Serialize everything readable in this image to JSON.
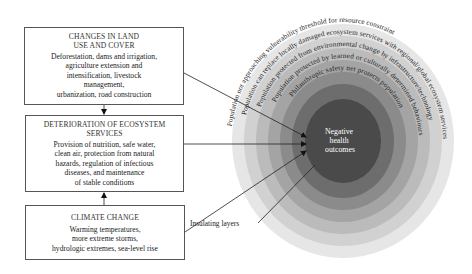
{
  "boxes": {
    "land": {
      "title_line1": "CHANGES IN LAND",
      "title_line2": "USE AND COVER",
      "body_lines": [
        "Deforestation, dams and irrigation,",
        "agriculture extension and",
        "intensification, livestock",
        "management,",
        "urbanization, road construction"
      ]
    },
    "ecosystem": {
      "title_line1": "DETERIORATION OF ECOSYSTEM",
      "title_line2": "SERVICES",
      "body_lines": [
        "Provision of nutrition, safe water,",
        "clean air, protection from natural",
        "hazards, regulation of infectious",
        "diseases, and maintenance",
        "of stable conditions"
      ]
    },
    "climate": {
      "title": "CLIMATE CHANGE",
      "body_lines": [
        "Warming temperatures,",
        "more extreme storms,",
        "hydrologic extremes, sea-level rise"
      ]
    }
  },
  "circle": {
    "center_lines": [
      "Negative",
      "health",
      "outcomes"
    ],
    "rings": [
      {
        "label": "Population not approaching vulnerability threshold for resource constraint",
        "color": "#e4e4e4"
      },
      {
        "label": "Population can replace locally damaged ecosystem services with regional/global ecosystem services",
        "color": "#d0d0d0"
      },
      {
        "label": "Population protected from environmental change by infrastructure/technology",
        "color": "#bababa"
      },
      {
        "label": "Population protected by learned or culturally determined behaviours",
        "color": "#a3a3a3"
      },
      {
        "label": "Philanthropic safety net protects population",
        "color": "#8a8a8a"
      }
    ],
    "inner_ring_color": "#6c6c6c",
    "center_color": "#4a4a4a"
  },
  "annotation": {
    "insulating_layers": "Insulating layers"
  }
}
